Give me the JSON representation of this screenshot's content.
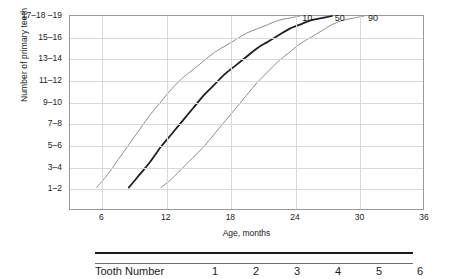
{
  "chart_data": {
    "type": "line",
    "title": "",
    "xlabel": "Age, months",
    "ylabel": "Number of primary teeth",
    "xlim": [
      3,
      36
    ],
    "ylim": [
      0,
      9
    ],
    "grid": true,
    "legend_position": "inline-curve-labels",
    "xticks": [
      6,
      12,
      18,
      24,
      30,
      36
    ],
    "yticks": [
      "1–2",
      "3–4",
      "5–6",
      "7–8",
      "9–10",
      "11–12",
      "13–14",
      "15–16",
      "17–18 –19"
    ],
    "ytick_values": [
      1,
      2,
      3,
      4,
      5,
      6,
      7,
      8,
      9
    ],
    "series": [
      {
        "name": "10",
        "label": "10",
        "color": "#8c8c8c",
        "width": 1,
        "points": [
          [
            5.5,
            1.0
          ],
          [
            6.5,
            1.6
          ],
          [
            7.5,
            2.3
          ],
          [
            8.5,
            3.0
          ],
          [
            9.5,
            3.7
          ],
          [
            10.5,
            4.4
          ],
          [
            11.5,
            5.0
          ],
          [
            12.5,
            5.6
          ],
          [
            13.5,
            6.1
          ],
          [
            14.5,
            6.5
          ],
          [
            15.5,
            6.9
          ],
          [
            16.5,
            7.3
          ],
          [
            17.5,
            7.6
          ],
          [
            18.5,
            7.9
          ],
          [
            19.5,
            8.2
          ],
          [
            20.5,
            8.4
          ],
          [
            21.5,
            8.6
          ],
          [
            22.5,
            8.8
          ],
          [
            23.5,
            8.9
          ],
          [
            24.5,
            9.0
          ]
        ]
      },
      {
        "name": "50",
        "label": "50",
        "color": "#1f1f1f",
        "width": 1.8,
        "points": [
          [
            8.5,
            1.0
          ],
          [
            9.5,
            1.6
          ],
          [
            10.5,
            2.2
          ],
          [
            11.5,
            2.9
          ],
          [
            12.5,
            3.5
          ],
          [
            13.5,
            4.1
          ],
          [
            14.5,
            4.7
          ],
          [
            15.5,
            5.3
          ],
          [
            16.5,
            5.8
          ],
          [
            17.5,
            6.3
          ],
          [
            18.5,
            6.7
          ],
          [
            19.5,
            7.1
          ],
          [
            20.5,
            7.5
          ],
          [
            21.5,
            7.8
          ],
          [
            22.5,
            8.1
          ],
          [
            23.5,
            8.4
          ],
          [
            24.5,
            8.6
          ],
          [
            25.5,
            8.8
          ],
          [
            26.5,
            8.9
          ],
          [
            27.5,
            9.0
          ]
        ]
      },
      {
        "name": "90",
        "label": "90",
        "color": "#8c8c8c",
        "width": 1,
        "points": [
          [
            11.5,
            1.0
          ],
          [
            12.5,
            1.4
          ],
          [
            13.5,
            1.9
          ],
          [
            14.5,
            2.4
          ],
          [
            15.5,
            2.9
          ],
          [
            16.5,
            3.5
          ],
          [
            17.5,
            4.1
          ],
          [
            18.5,
            4.7
          ],
          [
            19.5,
            5.3
          ],
          [
            20.5,
            5.9
          ],
          [
            21.5,
            6.4
          ],
          [
            22.5,
            6.9
          ],
          [
            23.5,
            7.3
          ],
          [
            24.5,
            7.7
          ],
          [
            25.5,
            8.0
          ],
          [
            26.5,
            8.3
          ],
          [
            27.5,
            8.6
          ],
          [
            28.5,
            8.8
          ],
          [
            29.5,
            8.9
          ],
          [
            30.5,
            9.0
          ]
        ]
      }
    ],
    "curve_labels": [
      {
        "text": "10",
        "x": 24.6,
        "y": 8.85
      },
      {
        "text": "50",
        "x": 27.6,
        "y": 8.85
      },
      {
        "text": "90",
        "x": 30.7,
        "y": 8.85
      }
    ]
  },
  "table": {
    "row_label": "Tooth Number",
    "columns": [
      "1",
      "2",
      "3",
      "4",
      "5",
      "6",
      "7"
    ]
  }
}
